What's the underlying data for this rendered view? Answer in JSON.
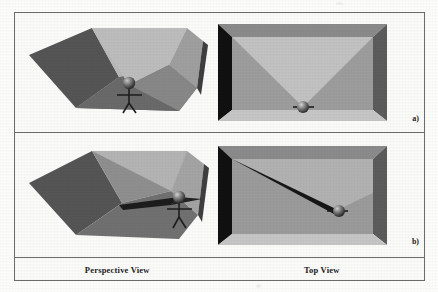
{
  "figure": {
    "panels": [
      {
        "id": "a",
        "label": "a)",
        "perspective": {
          "name": "perspective-view-panel-a",
          "description": "Room interior seen in perspective with observer standing near the front wall",
          "observer_position": "front-center",
          "visibility_region": "wide cone covering most of the room floor"
        },
        "topview": {
          "name": "top-view-panel-a",
          "description": "Rectangular room seen from above with observer at bottom center and a wide triangular visibility cone opening upward",
          "observer_position": "bottom-center",
          "visibility_region": "wide triangular cone"
        }
      },
      {
        "id": "b",
        "label": "b)",
        "perspective": {
          "name": "perspective-view-panel-b",
          "description": "Room interior seen in perspective with observer moved toward the right wall and a narrow dark wedge of visibility",
          "observer_position": "right side",
          "visibility_region": "narrow sliver wedge toward the far left corner"
        },
        "topview": {
          "name": "top-view-panel-b",
          "description": "Rectangular room seen from above with observer at lower right and a thin beam of visibility reaching the upper left corner",
          "observer_position": "lower-right",
          "visibility_region": "narrow beam to upper-left corner"
        }
      }
    ],
    "captions": {
      "left": "Perspective View",
      "right": "Top View"
    },
    "colors": {
      "page_background": "#fdfdfc",
      "frame_border": "#6d6d6d",
      "wall_darkest": "#0d0d0d",
      "wall_dark": "#585858",
      "wall_mid": "#8e8e8e",
      "wall_light": "#b4b4b4",
      "wall_lightest": "#cfcfcf",
      "floor_light": "#c4c4c4",
      "figure_ink": "#1e1e1e",
      "caption_text": "#1b1b1b"
    }
  }
}
